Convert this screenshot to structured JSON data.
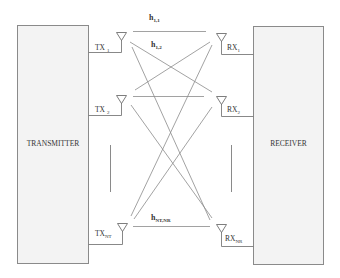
{
  "diagram": {
    "transmitter": {
      "label": "TRANSMITTER",
      "antennas": [
        {
          "name": "TX",
          "sub": "1"
        },
        {
          "name": "TX",
          "sub": "2"
        },
        {
          "name": "TX",
          "sub": "NT"
        }
      ]
    },
    "receiver": {
      "label": "RECEIVER",
      "antennas": [
        {
          "name": "RX",
          "sub": "1"
        },
        {
          "name": "RX",
          "sub": "2"
        },
        {
          "name": "RX",
          "sub": "NR"
        }
      ]
    },
    "channels": [
      {
        "name": "h",
        "sub": "1,1"
      },
      {
        "name": "h",
        "sub": "1,2"
      },
      {
        "name": "h",
        "sub": "NT,NR"
      }
    ],
    "colors": {
      "box_fill": "#f3f3f3",
      "box_stroke": "#8a8a8a",
      "line": "#7a7a7a",
      "text": "#333333"
    }
  }
}
